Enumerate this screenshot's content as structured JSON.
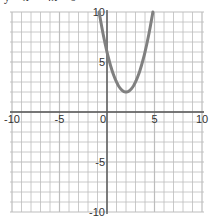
{
  "chart_data": {
    "type": "line",
    "title": "y = x² − 4x + 6",
    "xlabel": "",
    "ylabel": "",
    "xlim": [
      -10,
      10
    ],
    "ylim": [
      -10,
      10
    ],
    "grid": true,
    "grid_step": 1,
    "x_ticks": [
      -10,
      -5,
      0,
      5,
      10
    ],
    "y_ticks": [
      10,
      5,
      -5,
      -10
    ],
    "x_tick_labels": [
      "-10",
      "-5",
      "0",
      "5",
      "10"
    ],
    "y_tick_labels": [
      "10",
      "5",
      "-5",
      "-10"
    ],
    "series": [
      {
        "name": "parabola",
        "equation": "y = (x - 2)^2 + 2",
        "vertex": [
          2,
          2
        ],
        "color": "#808080",
        "x": [
          -0.83,
          0,
          1,
          2,
          3,
          4,
          4.83
        ],
        "y": [
          10,
          6,
          3,
          2,
          3,
          6,
          10
        ]
      }
    ],
    "colors": {
      "grid": "#bdbdbd",
      "axis": "#555555",
      "curve": "#808080"
    }
  }
}
